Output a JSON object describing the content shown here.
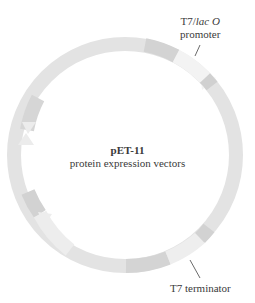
{
  "diagram": {
    "type": "plasmid-map",
    "center_title": "pET-11",
    "center_subtitle": "protein expression vectors",
    "labels": {
      "promoter_line1_a": "T7/",
      "promoter_line1_b": "lac O",
      "promoter_line2": "promoter",
      "terminator": "T7 terminator"
    },
    "colors": {
      "ring": "#e4e4e4",
      "segment_dark": "#d2d2d2",
      "segment_light": "#f1f1f1",
      "text": "#3a3a3a"
    }
  }
}
